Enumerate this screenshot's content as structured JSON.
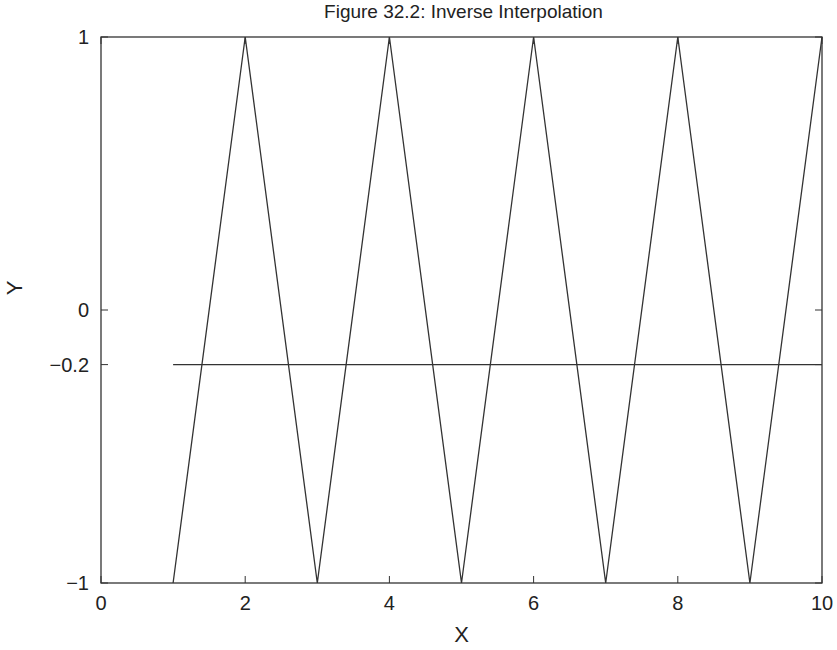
{
  "chart_data": {
    "type": "line",
    "title": "Figure 32.2: Inverse Interpolation",
    "xlabel": "X",
    "ylabel": "Y",
    "xlim": [
      0,
      10
    ],
    "ylim": [
      -1,
      1
    ],
    "xticks": [
      0,
      2,
      4,
      6,
      8,
      10
    ],
    "xtick_labels": [
      "0",
      "2",
      "4",
      "6",
      "8",
      "10"
    ],
    "yticks": [
      -1,
      -0.2,
      0,
      1
    ],
    "ytick_labels": [
      "−1",
      "−0.2",
      "0",
      "1"
    ],
    "grid": false,
    "legend": null,
    "series": [
      {
        "name": "zigzag",
        "x": [
          1,
          2,
          3,
          4,
          5,
          6,
          7,
          8,
          9,
          10
        ],
        "y": [
          -1,
          1,
          -1,
          1,
          -1,
          1,
          -1,
          1,
          -1,
          1
        ]
      },
      {
        "name": "target level",
        "x": [
          1,
          10
        ],
        "y": [
          -0.2,
          -0.2
        ]
      }
    ]
  }
}
